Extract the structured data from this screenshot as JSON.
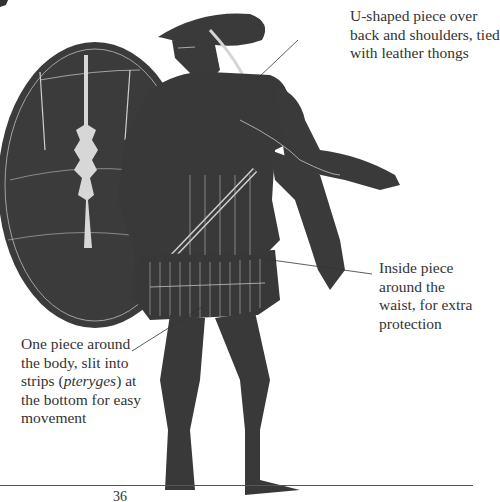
{
  "page": {
    "page_number": "36"
  },
  "illustration": {
    "subject": "greek-warrior-vase-painting",
    "colors": {
      "figure": "#3a3a3a",
      "outline": "#cfcfcf",
      "background": "#ffffff",
      "leader": "#333333"
    }
  },
  "annotations": {
    "corslet_shoulders": {
      "lines": [
        "U-shaped piece over",
        "back and shoulders, tied",
        "with leather thongs"
      ]
    },
    "waist_piece": {
      "lines": [
        "Inside piece",
        "around the",
        "waist, for extra",
        "protection"
      ]
    },
    "body_piece": {
      "line1": "One piece around",
      "line2": "the body, slit into",
      "line3_pre": "strips (",
      "line3_italic": "pteryges",
      "line3_post": ") at",
      "line4": "the bottom for easy",
      "line5": "movement"
    }
  }
}
